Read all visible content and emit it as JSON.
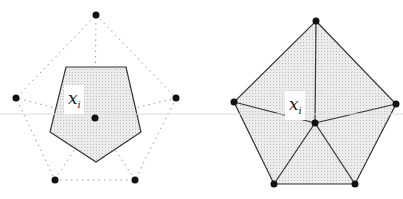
{
  "figure": {
    "guide_line": {
      "y": 114,
      "color": "#dcdcdc"
    },
    "colors": {
      "fill": "#e3e3e3",
      "stroke": "#333333",
      "dot": "#111111",
      "dotted": "#999999"
    },
    "left_panel": {
      "label": {
        "var": "x",
        "sub": "i"
      },
      "center": [
        95,
        118
      ],
      "neighbors": [
        [
          96,
          15
        ],
        [
          176,
          98
        ],
        [
          135,
          180
        ],
        [
          55,
          180
        ],
        [
          16,
          98
        ]
      ],
      "cell": [
        [
          66,
          67
        ],
        [
          126,
          67
        ],
        [
          141,
          132
        ],
        [
          96,
          162
        ],
        [
          50,
          132
        ]
      ]
    },
    "right_panel": {
      "label": {
        "var": "x",
        "sub": "i"
      },
      "center": [
        315,
        123
      ],
      "neighbors": [
        [
          316,
          21
        ],
        [
          396,
          104
        ],
        [
          355,
          184
        ],
        [
          274,
          184
        ],
        [
          234,
          102
        ]
      ]
    }
  }
}
